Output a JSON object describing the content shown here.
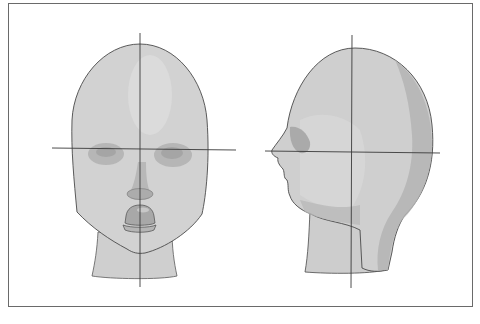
{
  "figure": {
    "views": [
      {
        "id": "front",
        "label": "Front view",
        "center_x": 140,
        "eye_line_y": 149
      },
      {
        "id": "profile",
        "label": "Profile view",
        "center_x": 352,
        "eye_line_y": 152
      }
    ],
    "colors": {
      "frame": "#6a6a6a",
      "skin_light": "#d4d4d4",
      "skin_mid": "#c2c2c2",
      "skin_dark": "#a9a9a9",
      "outline": "#4a4a4a",
      "guide_line": "#3a3a3a",
      "background": "#ffffff"
    }
  }
}
